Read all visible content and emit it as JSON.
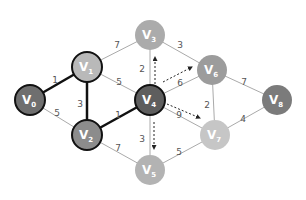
{
  "diagram": {
    "type": "weighted-undirected-graph",
    "nodes": [
      {
        "id": "V0",
        "base": "V",
        "sub": "0",
        "x": 30,
        "y": 100,
        "fill": "#6f6f6f",
        "stroke": "#111111",
        "stroke_width": 2
      },
      {
        "id": "V1",
        "base": "V",
        "sub": "1",
        "x": 87,
        "y": 67,
        "fill": "#b9b9b9",
        "stroke": "#111111",
        "stroke_width": 2
      },
      {
        "id": "V2",
        "base": "V",
        "sub": "2",
        "x": 87,
        "y": 135,
        "fill": "#8c8c8c",
        "stroke": "#111111",
        "stroke_width": 2
      },
      {
        "id": "V3",
        "base": "V",
        "sub": "3",
        "x": 150,
        "y": 35,
        "fill": "#ababab",
        "stroke": "none",
        "stroke_width": 0
      },
      {
        "id": "V4",
        "base": "V",
        "sub": "4",
        "x": 150,
        "y": 100,
        "fill": "#5e5e5e",
        "stroke": "#111111",
        "stroke_width": 2
      },
      {
        "id": "V5",
        "base": "V",
        "sub": "5",
        "x": 150,
        "y": 170,
        "fill": "#b3b3b3",
        "stroke": "none",
        "stroke_width": 0
      },
      {
        "id": "V6",
        "base": "V",
        "sub": "6",
        "x": 212,
        "y": 70,
        "fill": "#9c9c9c",
        "stroke": "none",
        "stroke_width": 0
      },
      {
        "id": "V7",
        "base": "V",
        "sub": "7",
        "x": 215,
        "y": 135,
        "fill": "#c6c6c6",
        "stroke": "none",
        "stroke_width": 0
      },
      {
        "id": "V8",
        "base": "V",
        "sub": "8",
        "x": 277,
        "y": 100,
        "fill": "#7b7b7b",
        "stroke": "none",
        "stroke_width": 0
      }
    ],
    "edges": [
      {
        "from": "V0",
        "to": "V1",
        "weight": "1",
        "bold": true,
        "lx": 55,
        "ly": 80
      },
      {
        "from": "V0",
        "to": "V2",
        "weight": "5",
        "bold": false,
        "lx": 57,
        "ly": 113
      },
      {
        "from": "V1",
        "to": "V2",
        "weight": "3",
        "bold": true,
        "lx": 80,
        "ly": 104
      },
      {
        "from": "V1",
        "to": "V3",
        "weight": "7",
        "bold": false,
        "lx": 117,
        "ly": 45
      },
      {
        "from": "V1",
        "to": "V4",
        "weight": "5",
        "bold": false,
        "lx": 119,
        "ly": 82
      },
      {
        "from": "V2",
        "to": "V4",
        "weight": "1",
        "bold": true,
        "lx": 118,
        "ly": 115
      },
      {
        "from": "V2",
        "to": "V5",
        "weight": "7",
        "bold": false,
        "lx": 118,
        "ly": 148
      },
      {
        "from": "V3",
        "to": "V4",
        "weight": "2",
        "bold": false,
        "lx": 142,
        "ly": 69
      },
      {
        "from": "V3",
        "to": "V6",
        "weight": "3",
        "bold": false,
        "lx": 180,
        "ly": 45
      },
      {
        "from": "V4",
        "to": "V6",
        "weight": "6",
        "bold": false,
        "lx": 180,
        "ly": 83
      },
      {
        "from": "V4",
        "to": "V5",
        "weight": "3",
        "bold": false,
        "lx": 142,
        "ly": 139
      },
      {
        "from": "V4",
        "to": "V7",
        "weight": "9",
        "bold": false,
        "lx": 179,
        "ly": 115
      },
      {
        "from": "V5",
        "to": "V7",
        "weight": "5",
        "bold": false,
        "lx": 179,
        "ly": 152
      },
      {
        "from": "V6",
        "to": "V7",
        "weight": "2",
        "bold": false,
        "lx": 207,
        "ly": 105
      },
      {
        "from": "V6",
        "to": "V8",
        "weight": "7",
        "bold": false,
        "lx": 244,
        "ly": 82
      },
      {
        "from": "V7",
        "to": "V8",
        "weight": "4",
        "bold": false,
        "lx": 243,
        "ly": 119
      }
    ],
    "dashed_arrows": [
      {
        "from_node": "V4",
        "to_node": "V3",
        "x1": 155,
        "y1": 84,
        "x2": 155,
        "y2": 57
      },
      {
        "from_node": "V4",
        "to_node": "V6",
        "x1": 163,
        "y1": 82,
        "x2": 192,
        "y2": 67
      },
      {
        "from_node": "V4",
        "to_node": "V7",
        "x1": 167,
        "y1": 104,
        "x2": 200,
        "y2": 118
      },
      {
        "from_node": "V4",
        "to_node": "V5",
        "x1": 154,
        "y1": 122,
        "x2": 154,
        "y2": 149
      }
    ],
    "node_radius": 15,
    "edge_color": "#aaaaaa",
    "bold_edge_color": "#111111",
    "arrow_color": "#222222"
  }
}
